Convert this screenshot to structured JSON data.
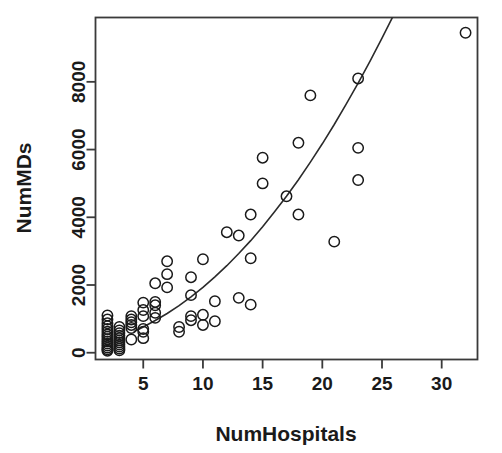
{
  "chart_data": {
    "type": "scatter",
    "title": "",
    "xlabel": "NumHospitals",
    "ylabel": "NumMDs",
    "xlim": [
      1,
      33
    ],
    "ylim": [
      -200,
      9900
    ],
    "grid": false,
    "legend": null,
    "xticks": [
      5,
      10,
      15,
      20,
      25,
      30
    ],
    "xtick_labels": [
      "5",
      "10",
      "15",
      "20",
      "25",
      "30"
    ],
    "yticks": [
      0,
      2000,
      4000,
      6000,
      8000
    ],
    "ytick_labels": [
      "0",
      "2000",
      "4000",
      "6000",
      "8000"
    ],
    "marker": "open-circle",
    "marker_color": "#1a1a1a",
    "points": [
      {
        "x": 2,
        "y": 1100
      },
      {
        "x": 2,
        "y": 980
      },
      {
        "x": 2,
        "y": 870
      },
      {
        "x": 2,
        "y": 780
      },
      {
        "x": 2,
        "y": 700
      },
      {
        "x": 2,
        "y": 620
      },
      {
        "x": 2,
        "y": 540
      },
      {
        "x": 2,
        "y": 470
      },
      {
        "x": 2,
        "y": 400
      },
      {
        "x": 2,
        "y": 330
      },
      {
        "x": 2,
        "y": 270
      },
      {
        "x": 2,
        "y": 210
      },
      {
        "x": 2,
        "y": 150
      },
      {
        "x": 2,
        "y": 100
      },
      {
        "x": 2,
        "y": 60
      },
      {
        "x": 3,
        "y": 760
      },
      {
        "x": 3,
        "y": 660
      },
      {
        "x": 3,
        "y": 580
      },
      {
        "x": 3,
        "y": 500
      },
      {
        "x": 3,
        "y": 430
      },
      {
        "x": 3,
        "y": 360
      },
      {
        "x": 3,
        "y": 300
      },
      {
        "x": 3,
        "y": 240
      },
      {
        "x": 3,
        "y": 180
      },
      {
        "x": 3,
        "y": 120
      },
      {
        "x": 3,
        "y": 70
      },
      {
        "x": 4,
        "y": 1080
      },
      {
        "x": 4,
        "y": 980
      },
      {
        "x": 4,
        "y": 900
      },
      {
        "x": 4,
        "y": 820
      },
      {
        "x": 4,
        "y": 730
      },
      {
        "x": 4,
        "y": 390
      },
      {
        "x": 5,
        "y": 1480
      },
      {
        "x": 5,
        "y": 1260
      },
      {
        "x": 5,
        "y": 1080
      },
      {
        "x": 5,
        "y": 700
      },
      {
        "x": 5,
        "y": 620
      },
      {
        "x": 5,
        "y": 430
      },
      {
        "x": 6,
        "y": 2050
      },
      {
        "x": 6,
        "y": 1500
      },
      {
        "x": 6,
        "y": 1400
      },
      {
        "x": 6,
        "y": 1180
      },
      {
        "x": 6,
        "y": 1030
      },
      {
        "x": 7,
        "y": 2700
      },
      {
        "x": 7,
        "y": 2320
      },
      {
        "x": 7,
        "y": 1930
      },
      {
        "x": 8,
        "y": 760
      },
      {
        "x": 8,
        "y": 620
      },
      {
        "x": 9,
        "y": 2230
      },
      {
        "x": 9,
        "y": 1700
      },
      {
        "x": 9,
        "y": 1080
      },
      {
        "x": 9,
        "y": 960
      },
      {
        "x": 10,
        "y": 2760
      },
      {
        "x": 10,
        "y": 1120
      },
      {
        "x": 10,
        "y": 820
      },
      {
        "x": 11,
        "y": 1520
      },
      {
        "x": 11,
        "y": 930
      },
      {
        "x": 12,
        "y": 3560
      },
      {
        "x": 13,
        "y": 3460
      },
      {
        "x": 13,
        "y": 1620
      },
      {
        "x": 14,
        "y": 4080
      },
      {
        "x": 14,
        "y": 2790
      },
      {
        "x": 14,
        "y": 1420
      },
      {
        "x": 15,
        "y": 5760
      },
      {
        "x": 15,
        "y": 5000
      },
      {
        "x": 17,
        "y": 4620
      },
      {
        "x": 18,
        "y": 6200
      },
      {
        "x": 18,
        "y": 4080
      },
      {
        "x": 19,
        "y": 7600
      },
      {
        "x": 21,
        "y": 3280
      },
      {
        "x": 23,
        "y": 8100
      },
      {
        "x": 23,
        "y": 6050
      },
      {
        "x": 23,
        "y": 5100
      },
      {
        "x": 32,
        "y": 9450
      }
    ],
    "fit_curve": {
      "name": "fitted-curve",
      "color": "#2b2b2b",
      "x": [
        4.2,
        5,
        6,
        7,
        8,
        9,
        10,
        11,
        12,
        13,
        14,
        15,
        16,
        17,
        18,
        19,
        20,
        21,
        22,
        23,
        24,
        25,
        26,
        27,
        28,
        29
      ],
      "y": [
        620,
        760,
        950,
        1160,
        1390,
        1650,
        1930,
        2240,
        2570,
        2930,
        3310,
        3720,
        4160,
        4620,
        5110,
        5630,
        6170,
        6740,
        7340,
        7960,
        8610,
        9290,
        9990,
        10720,
        11470,
        12260
      ]
    }
  }
}
